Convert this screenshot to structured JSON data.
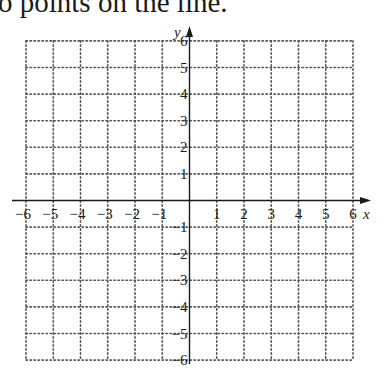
{
  "header": {
    "text": "o points on the line."
  },
  "graph": {
    "x_axis_label": "x",
    "y_axis_label": "y",
    "x_range": [
      -6,
      6
    ],
    "y_range": [
      -6,
      6
    ],
    "grid": "dotted",
    "x_tick_labels": [
      "−6",
      "−5",
      "−4",
      "−3",
      "−2",
      "−1",
      "1",
      "2",
      "3",
      "4",
      "5",
      "6"
    ],
    "y_tick_labels": [
      "6",
      "5",
      "4",
      "3",
      "2",
      "1",
      "−1",
      "−2",
      "−3",
      "−4",
      "−5",
      "−6"
    ],
    "colors": {
      "axis": "#1a1a1a",
      "grid": "#555555",
      "background": "#ffffff"
    }
  }
}
